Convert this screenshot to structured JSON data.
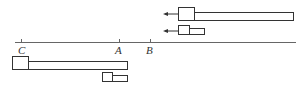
{
  "diagram": {
    "colors": {
      "stroke": "#333333",
      "fill": "#ffffff",
      "axis": "#555555"
    },
    "axis": {
      "points": [
        {
          "label": "C",
          "x": 21
        },
        {
          "label": "A",
          "x": 119
        },
        {
          "label": "B",
          "x": 150
        }
      ]
    },
    "objects": [
      {
        "name": "upper-large-body",
        "moving": true,
        "direction": "left"
      },
      {
        "name": "upper-small-body",
        "moving": true,
        "direction": "left"
      },
      {
        "name": "lower-large-body",
        "moving": false
      },
      {
        "name": "lower-small-body",
        "moving": false
      }
    ]
  }
}
